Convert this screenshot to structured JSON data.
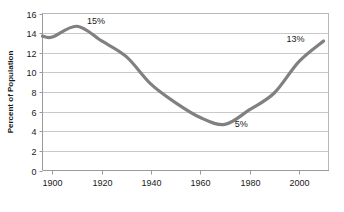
{
  "chart_data": {
    "type": "line",
    "title": "",
    "xlabel": "",
    "ylabel": "Percent of Population",
    "xlim": [
      1896,
      2012
    ],
    "ylim": [
      0,
      16
    ],
    "grid": true,
    "legend": "none",
    "line_color": "#808080",
    "grid_color": "#c9c9c9",
    "frame_color": "#b0b0b0",
    "xticks": [
      1900,
      1920,
      1940,
      1960,
      1980,
      2000
    ],
    "xtick_labels": [
      "1900",
      "1920",
      "1940",
      "1960",
      "1980",
      "2000"
    ],
    "yticks": [
      0,
      2,
      4,
      6,
      8,
      10,
      12,
      14,
      16
    ],
    "ytick_labels": [
      "0",
      "2",
      "4",
      "6",
      "8",
      "10",
      "12",
      "14",
      "16"
    ],
    "series": [
      {
        "name": "Percent of Population",
        "x": [
          1896,
          1900,
          1910,
          1920,
          1930,
          1940,
          1950,
          1960,
          1970,
          1980,
          1990,
          2000,
          2010
        ],
        "values": [
          13.7,
          13.6,
          14.7,
          13.2,
          11.6,
          8.8,
          6.9,
          5.4,
          4.7,
          6.2,
          7.9,
          11.1,
          13.2
        ]
      }
    ],
    "annotations": [
      {
        "text": "15%",
        "x": 1914,
        "y": 14.9,
        "series_point_x": 1910,
        "series_point_y": 14.7
      },
      {
        "text": "5%",
        "x": 1974,
        "y": 4.4,
        "series_point_x": 1970,
        "series_point_y": 4.7
      },
      {
        "text": "13%",
        "x": 1995,
        "y": 13.1,
        "series_point_x": 2010,
        "series_point_y": 13.2
      }
    ]
  }
}
